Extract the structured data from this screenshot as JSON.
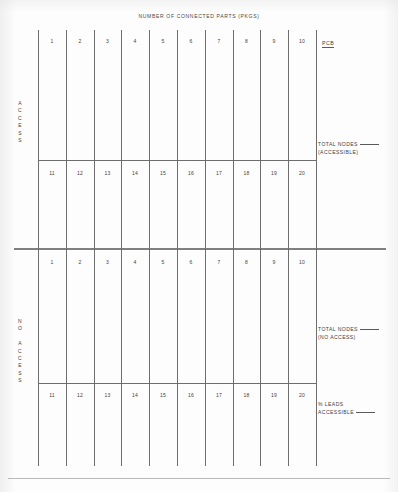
{
  "form": {
    "title": "NUMBER OF CONNECTED PARTS (PKGS)",
    "background_color": "#fdfdfd",
    "line_color": "#6e6e6e",
    "text_color": "#3f3f3f"
  },
  "sections": [
    {
      "id": "access",
      "side_label_lines": [
        "A",
        "C",
        "C",
        "E",
        "S",
        "S"
      ],
      "side_label_text": "ACCESS",
      "rows": [
        {
          "id": "access-row-1",
          "cells": [
            "1",
            "2",
            "3",
            "4",
            "5",
            "6",
            "7",
            "8",
            "9",
            "10"
          ]
        },
        {
          "id": "access-row-2",
          "cells": [
            "11",
            "12",
            "13",
            "14",
            "15",
            "16",
            "17",
            "18",
            "19",
            "20"
          ]
        }
      ],
      "annotations": [
        {
          "id": "pcb",
          "text": "PCB",
          "underlined": true
        },
        {
          "id": "total-nodes-accessible",
          "line1": "TOTAL NODES",
          "line2": "(ACCESSIBLE)",
          "has_blank": true
        }
      ]
    },
    {
      "id": "no-access",
      "side_label_lines": [
        "N",
        "O",
        "",
        "A",
        "C",
        "C",
        "E",
        "S",
        "S"
      ],
      "side_label_text": "NO ACCESS",
      "rows": [
        {
          "id": "no-access-row-1",
          "cells": [
            "1",
            "2",
            "3",
            "4",
            "5",
            "6",
            "7",
            "8",
            "9",
            "10"
          ]
        },
        {
          "id": "no-access-row-2",
          "cells": [
            "11",
            "12",
            "13",
            "14",
            "15",
            "16",
            "17",
            "18",
            "19",
            "20"
          ]
        }
      ],
      "annotations": [
        {
          "id": "total-nodes-no-access",
          "line1": "TOTAL NODES",
          "line2": "(NO ACCESS)",
          "has_blank": true
        },
        {
          "id": "percent-leads-accessible",
          "line1": "% LEADS",
          "line2": "ACCESSIBLE",
          "has_blank": true
        }
      ]
    }
  ],
  "labels": {
    "title": "NUMBER OF CONNECTED PARTS (PKGS)",
    "pcb": "PCB",
    "total_nodes": "TOTAL NODES",
    "accessible_paren": "(ACCESSIBLE)",
    "no_access_paren": "(NO ACCESS)",
    "percent_leads": "% LEADS",
    "accessible": "ACCESSIBLE",
    "access_a": "A",
    "access_c1": "C",
    "access_c2": "C",
    "access_e": "E",
    "access_s1": "S",
    "access_s2": "S",
    "no_n": "N",
    "no_o": "O",
    "na_a": "A",
    "na_c1": "C",
    "na_c2": "C",
    "na_e": "E",
    "na_s1": "S",
    "na_s2": "S"
  },
  "cells": {
    "top_row_1": "1",
    "top_row_2": "2",
    "top_row_3": "3",
    "top_row_4": "4",
    "top_row_5": "5",
    "top_row_6": "6",
    "top_row_7": "7",
    "top_row_8": "8",
    "top_row_9": "9",
    "top_row_10": "10",
    "second_row_11": "11",
    "second_row_12": "12",
    "second_row_13": "13",
    "second_row_14": "14",
    "second_row_15": "15",
    "second_row_16": "16",
    "second_row_17": "17",
    "second_row_18": "18",
    "second_row_19": "19",
    "second_row_20": "20",
    "third_row_1": "1",
    "third_row_2": "2",
    "third_row_3": "3",
    "third_row_4": "4",
    "third_row_5": "5",
    "third_row_6": "6",
    "third_row_7": "7",
    "third_row_8": "8",
    "third_row_9": "9",
    "third_row_10": "10",
    "fourth_row_11": "11",
    "fourth_row_12": "12",
    "fourth_row_13": "13",
    "fourth_row_14": "14",
    "fourth_row_15": "15",
    "fourth_row_16": "16",
    "fourth_row_17": "17",
    "fourth_row_18": "18",
    "fourth_row_19": "19",
    "fourth_row_20": "20"
  }
}
